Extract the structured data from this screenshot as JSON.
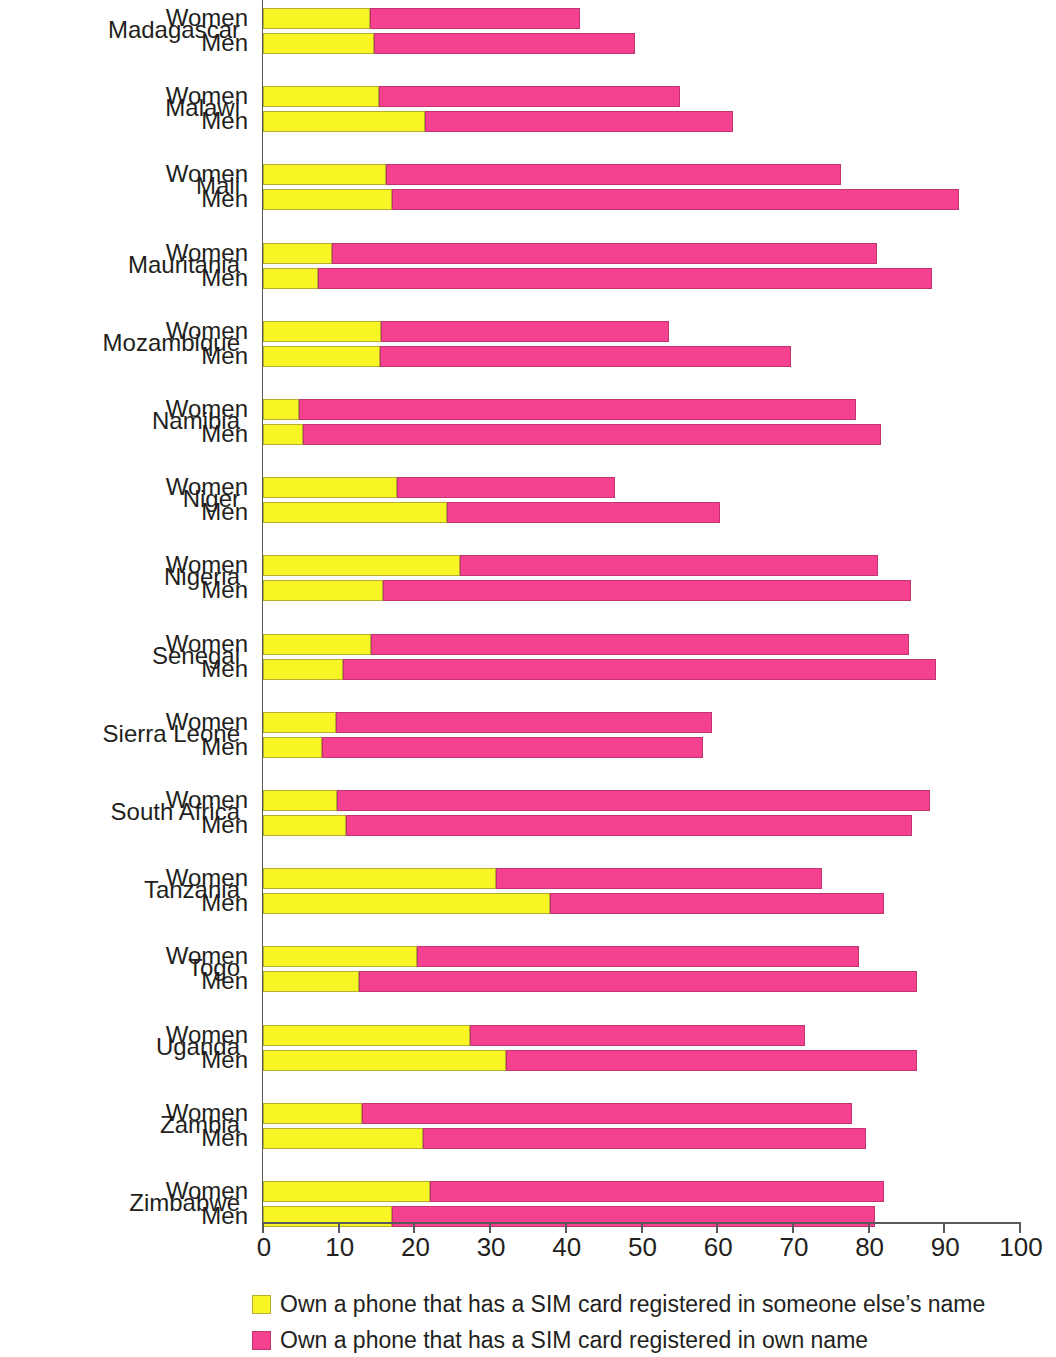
{
  "chart_data": {
    "type": "bar",
    "orientation": "horizontal",
    "stacked": true,
    "title": "",
    "xlabel": "",
    "ylabel": "",
    "xlim": [
      0,
      100
    ],
    "xticks": [
      0,
      10,
      20,
      30,
      40,
      50,
      60,
      70,
      80,
      90,
      100
    ],
    "xtick_labels": [
      "0",
      "10",
      "20",
      "30",
      "40",
      "50",
      "60",
      "70",
      "80",
      "90",
      "100"
    ],
    "grid": false,
    "legend_position": "bottom-left",
    "colors": {
      "someone_else": "#f9f423",
      "own_name": "#f5418f"
    },
    "series": [
      {
        "name": "Own a phone that has a SIM card registered in someone else’s name",
        "key": "someone_else",
        "color": "#f9f423"
      },
      {
        "name": "Own a phone that has a SIM card registered in own name",
        "key": "own_name",
        "color": "#f5418f"
      }
    ],
    "categories": [
      "Madagascar",
      "Malawi",
      "Mali",
      "Mauritania",
      "Mozambique",
      "Namibia",
      "Niger",
      "Nigeria",
      "Senegal",
      "Sierra Leone",
      "South Africa",
      "Tanzania",
      "Togo",
      "Uganda",
      "Zambia",
      "Zimbabwe"
    ],
    "subcategories": [
      "Women",
      "Men"
    ],
    "rows": [
      {
        "country": "Madagascar",
        "Women": {
          "someone_else": 14.1,
          "own_name": 27.8,
          "total": 41.9
        },
        "Men": {
          "someone_else": 14.7,
          "own_name": 34.4,
          "total": 49.1
        }
      },
      {
        "country": "Malawi",
        "Women": {
          "someone_else": 15.3,
          "own_name": 39.8,
          "total": 55.1
        },
        "Men": {
          "someone_else": 21.4,
          "own_name": 40.7,
          "total": 62.1
        }
      },
      {
        "country": "Mali",
        "Women": {
          "someone_else": 16.2,
          "own_name": 60.2,
          "total": 76.4
        },
        "Men": {
          "someone_else": 17.0,
          "own_name": 74.9,
          "total": 91.9
        }
      },
      {
        "country": "Mauritania",
        "Women": {
          "someone_else": 9.1,
          "own_name": 72.0,
          "total": 81.1
        },
        "Men": {
          "someone_else": 7.3,
          "own_name": 81.1,
          "total": 88.4
        }
      },
      {
        "country": "Mozambique",
        "Women": {
          "someone_else": 15.6,
          "own_name": 38.0,
          "total": 53.6
        },
        "Men": {
          "someone_else": 15.5,
          "own_name": 54.2,
          "total": 69.7
        }
      },
      {
        "country": "Namibia",
        "Women": {
          "someone_else": 4.8,
          "own_name": 73.6,
          "total": 78.4
        },
        "Men": {
          "someone_else": 5.3,
          "own_name": 76.3,
          "total": 81.6
        }
      },
      {
        "country": "Niger",
        "Women": {
          "someone_else": 17.7,
          "own_name": 28.8,
          "total": 46.5
        },
        "Men": {
          "someone_else": 24.3,
          "own_name": 36.1,
          "total": 60.4
        }
      },
      {
        "country": "Nigeria",
        "Women": {
          "someone_else": 26.0,
          "own_name": 55.2,
          "total": 81.2
        },
        "Men": {
          "someone_else": 15.8,
          "own_name": 69.8,
          "total": 85.6
        }
      },
      {
        "country": "Senegal",
        "Women": {
          "someone_else": 14.3,
          "own_name": 71.1,
          "total": 85.4
        },
        "Men": {
          "someone_else": 10.6,
          "own_name": 78.3,
          "total": 88.9
        }
      },
      {
        "country": "Sierra Leone",
        "Women": {
          "someone_else": 9.7,
          "own_name": 49.6,
          "total": 59.3
        },
        "Men": {
          "someone_else": 7.8,
          "own_name": 50.3,
          "total": 58.1
        }
      },
      {
        "country": "South Africa",
        "Women": {
          "someone_else": 9.8,
          "own_name": 78.3,
          "total": 88.1
        },
        "Men": {
          "someone_else": 11.0,
          "own_name": 74.7,
          "total": 85.7
        }
      },
      {
        "country": "Tanzania",
        "Women": {
          "someone_else": 30.8,
          "own_name": 43.0,
          "total": 73.8
        },
        "Men": {
          "someone_else": 37.9,
          "own_name": 44.1,
          "total": 82.0
        }
      },
      {
        "country": "Togo",
        "Women": {
          "someone_else": 20.3,
          "own_name": 58.4,
          "total": 78.7
        },
        "Men": {
          "someone_else": 12.7,
          "own_name": 73.7,
          "total": 86.4
        }
      },
      {
        "country": "Uganda",
        "Women": {
          "someone_else": 27.3,
          "own_name": 44.3,
          "total": 71.6
        },
        "Men": {
          "someone_else": 32.1,
          "own_name": 54.3,
          "total": 86.4
        }
      },
      {
        "country": "Zambia",
        "Women": {
          "someone_else": 13.1,
          "own_name": 64.7,
          "total": 77.8
        },
        "Men": {
          "someone_else": 21.2,
          "own_name": 58.4,
          "total": 79.6
        }
      },
      {
        "country": "Zimbabwe",
        "Women": {
          "someone_else": 22.0,
          "own_name": 60.0,
          "total": 82.0
        },
        "Men": {
          "someone_else": 17.1,
          "own_name": 63.8,
          "total": 80.9
        }
      }
    ]
  },
  "legend": {
    "items": [
      {
        "swatch": "yellow",
        "label": "Own a phone that has a SIM card registered in someone else’s name"
      },
      {
        "swatch": "pink",
        "label": "Own a phone that has a SIM card registered in own name"
      }
    ]
  },
  "axis": {
    "tick_labels": [
      "0",
      "10",
      "20",
      "30",
      "40",
      "50",
      "60",
      "70",
      "80",
      "90",
      "100"
    ]
  }
}
